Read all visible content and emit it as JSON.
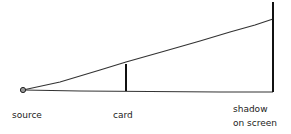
{
  "diagram": {
    "labels": {
      "source": "source",
      "card": "card",
      "shadow_line1": "shadow",
      "shadow_line2": "on screen"
    },
    "colors": {
      "stroke": "#222222",
      "background": "#ffffff"
    }
  }
}
